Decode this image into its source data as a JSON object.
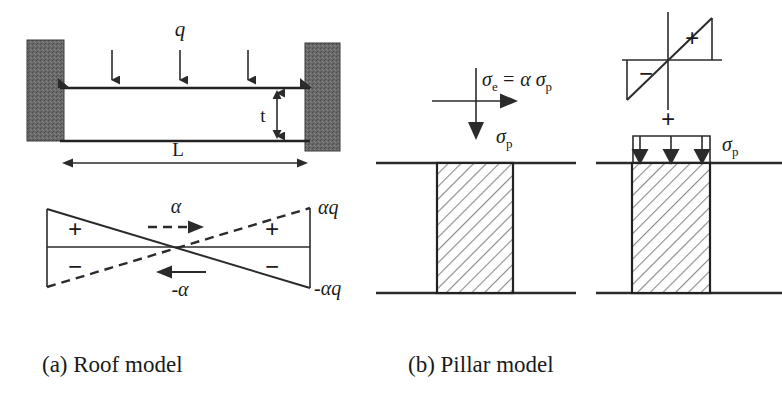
{
  "figure": {
    "background_color": "#ffffff",
    "ink_color": "#2b2b2b",
    "support_color": "#555555",
    "hatch_color": "#777777"
  },
  "panel_a": {
    "caption": "(a) Roof model",
    "labels": {
      "load": "q",
      "thickness": "t",
      "span": "L"
    },
    "load_arrow_count": 3,
    "stress_diagram": {
      "alpha_right": "α",
      "alpha_left": "-α",
      "top_right_value": "αq",
      "bottom_right_value": "-αq",
      "left_upper_sign": "+",
      "left_lower_sign": "−",
      "right_upper_sign": "+",
      "right_lower_sign": "−"
    }
  },
  "panel_b": {
    "caption": "(b) Pillar model",
    "left_pillar": {
      "horizontal_stress_expr": "σ",
      "horizontal_stress_sub": "e",
      "horizontal_stress_rest": "= α σ",
      "horizontal_stress_rest_sub": "p",
      "vertical_stress": "σ",
      "vertical_stress_sub": "p"
    },
    "right_pillar": {
      "bending_plus": "+",
      "bending_minus": "−",
      "combine_sign": "+",
      "load_label": "σ",
      "load_label_sub": "p",
      "load_arrow_count": 3
    }
  }
}
